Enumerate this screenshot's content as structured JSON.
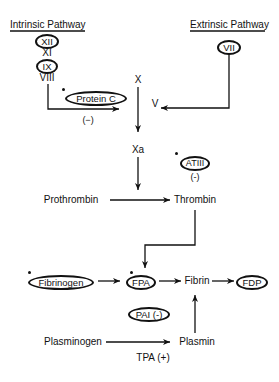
{
  "diagram": {
    "intrinsic": {
      "title": "Intrinsic Pathway",
      "factors": [
        "XII",
        "XI",
        "IX",
        "VIII"
      ]
    },
    "extrinsic": {
      "title": "Extrinsic Pathway",
      "factors": [
        "VII"
      ]
    },
    "nodes": {
      "x": "X",
      "v": "V",
      "xa": "Xa",
      "protein_c": "Protein C",
      "protein_c_effect": "(−)",
      "atiii": "ATIII",
      "atiii_effect": "(-)",
      "prothrombin": "Prothrombin",
      "thrombin": "Thrombin",
      "fibrinogen": "Fibrinogen",
      "fpa": "FPA",
      "fibrin": "Fibrin",
      "fdp": "FDP",
      "pai": "PAI (-)",
      "plasminogen": "Plasminogen",
      "plasmin": "Plasmin",
      "tpa": "TPA (+)"
    },
    "marked_nodes": [
      "Protein C",
      "ATIII",
      "Fibrinogen",
      "FPA"
    ]
  }
}
